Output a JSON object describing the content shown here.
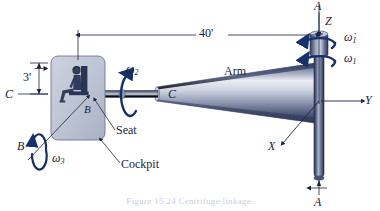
{
  "figure": {
    "type": "engineering-diagram",
    "caption": "Figure 15.24  Centrifuge linkage."
  },
  "colors": {
    "ink": "#1b2340",
    "arm_dark": "#3d4866",
    "arm_mid": "#7d88a4",
    "arm_light": "#e8ebf2",
    "shaft_dark": "#2b3554",
    "cockpit_fill": "#c2c8d6",
    "cockpit_edge": "#6b7governs",
    "figure_body": "#333c5c",
    "caption": "#c9cedd"
  },
  "dimensions": {
    "arm_length": "40'",
    "cockpit_height": "3'"
  },
  "axes": [
    {
      "name": "Z",
      "label": "Z",
      "orientation": "vertical-up"
    },
    {
      "name": "Y",
      "label": "Y",
      "orientation": "horizontal-right"
    },
    {
      "name": "X",
      "label": "X",
      "orientation": "out-of-plane"
    }
  ],
  "section_marks": {
    "shaft_top": "A",
    "shaft_bottom": "A",
    "arm_axis_left": "C",
    "arm_axis_right": "C",
    "cockpit_axis_upper": "B",
    "cockpit_axis_lower": "B"
  },
  "angular_velocities": [
    {
      "symbol": "ω̇",
      "subscript": "1",
      "about": "vertical A-A axis",
      "kind": "angular-acceleration"
    },
    {
      "symbol": "ω",
      "subscript": "1",
      "about": "vertical A-A axis",
      "kind": "angular-velocity"
    },
    {
      "symbol": "ω",
      "subscript": "2",
      "about": "horizontal arm C-C axis",
      "kind": "angular-velocity"
    },
    {
      "symbol": "ω",
      "subscript": "3",
      "about": "cockpit B-B axis",
      "kind": "angular-velocity"
    }
  ],
  "callouts": [
    {
      "label": "Arm",
      "target": "tapered rotating arm"
    },
    {
      "label": "Seat",
      "target": "seat inside cockpit"
    },
    {
      "label": "Cockpit",
      "target": "cockpit enclosure"
    }
  ]
}
